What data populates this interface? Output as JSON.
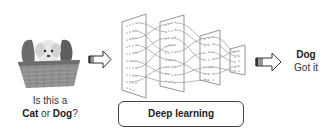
{
  "input": {
    "image_label": "puppy in wicker basket",
    "question_line1": "Is this a",
    "question_cat": "Cat",
    "question_or": " or ",
    "question_dog": "Dog",
    "question_mark": "?"
  },
  "model": {
    "label": "Deep learning",
    "layers": 4
  },
  "output": {
    "answer": "Dog",
    "status": "Got it"
  },
  "icons": {
    "arrow_in": "hollow-right-arrow",
    "arrow_out": "hollow-right-arrow"
  },
  "colors": {
    "line": "#8a8a8a",
    "text": "#222222",
    "background": "#ffffff"
  }
}
